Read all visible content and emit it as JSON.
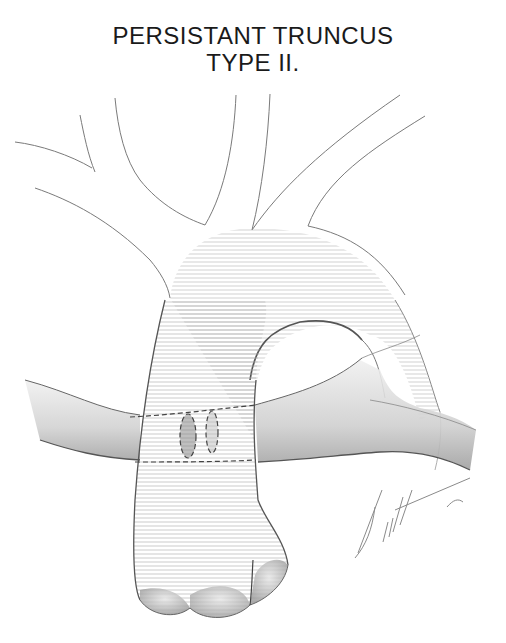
{
  "figure": {
    "title_line1": "PERSISTANT TRUNCUS",
    "title_line2": "TYPE II.",
    "signature": "Fink '88",
    "colors": {
      "line": "#6a6a6a",
      "shade": "#9a9a9a",
      "dark_shade": "#4a4a4a",
      "background": "#ffffff"
    }
  }
}
